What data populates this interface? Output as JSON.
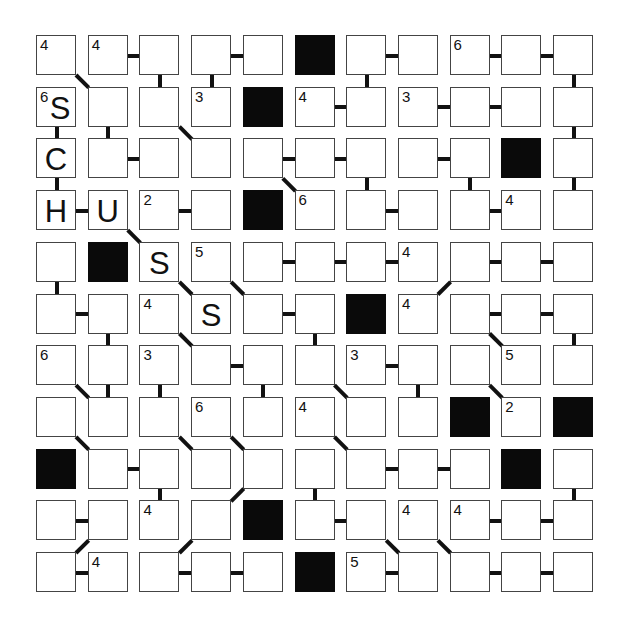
{
  "puzzle": {
    "type": "number-path-grid",
    "rows": 11,
    "cols": 11,
    "grid": [
      [
        {
          "c": "4"
        },
        {
          "c": "4"
        },
        {},
        {},
        {},
        {
          "b": 1
        },
        {},
        {},
        {
          "c": "6"
        },
        {},
        {}
      ],
      [
        {
          "c": "6",
          "l": "S"
        },
        {},
        {},
        {
          "c": "3"
        },
        {
          "b": 1
        },
        {
          "c": "4"
        },
        {},
        {
          "c": "3"
        },
        {},
        {},
        {}
      ],
      [
        {
          "l": "C"
        },
        {},
        {},
        {},
        {},
        {},
        {},
        {},
        {},
        {
          "b": 1
        },
        {}
      ],
      [
        {
          "l": "H"
        },
        {
          "l": "U"
        },
        {
          "c": "2"
        },
        {},
        {
          "b": 1
        },
        {
          "c": "6"
        },
        {},
        {},
        {},
        {
          "c": "4"
        },
        {}
      ],
      [
        {},
        {
          "b": 1
        },
        {
          "l": "S"
        },
        {
          "c": "5"
        },
        {},
        {},
        {},
        {
          "c": "4"
        },
        {},
        {},
        {}
      ],
      [
        {},
        {},
        {
          "c": "4"
        },
        {
          "l": "S"
        },
        {},
        {},
        {
          "b": 1
        },
        {
          "c": "4"
        },
        {},
        {},
        {}
      ],
      [
        {
          "c": "6"
        },
        {},
        {
          "c": "3"
        },
        {},
        {},
        {},
        {
          "c": "3"
        },
        {},
        {},
        {
          "c": "5"
        },
        {}
      ],
      [
        {},
        {},
        {},
        {
          "c": "6"
        },
        {},
        {
          "c": "4"
        },
        {},
        {},
        {
          "b": 1
        },
        {
          "c": "2"
        },
        {
          "b": 1
        }
      ],
      [
        {
          "b": 1
        },
        {},
        {},
        {},
        {},
        {},
        {},
        {},
        {},
        {
          "b": 1
        },
        {}
      ],
      [
        {},
        {},
        {
          "c": "4"
        },
        {},
        {
          "b": 1
        },
        {},
        {},
        {
          "c": "4"
        },
        {
          "c": "4"
        },
        {},
        {}
      ],
      [
        {},
        {
          "c": "4"
        },
        {},
        {},
        {},
        {
          "b": 1
        },
        {
          "c": "5"
        },
        {},
        {},
        {},
        {}
      ]
    ],
    "connectors": [
      [
        0,
        0,
        1,
        1
      ],
      [
        0,
        1,
        0,
        2
      ],
      [
        0,
        2,
        1,
        2
      ],
      [
        0,
        3,
        1,
        3
      ],
      [
        0,
        3,
        0,
        4
      ],
      [
        0,
        6,
        0,
        7
      ],
      [
        0,
        6,
        1,
        6
      ],
      [
        0,
        8,
        0,
        9
      ],
      [
        0,
        9,
        0,
        10
      ],
      [
        0,
        10,
        1,
        10
      ],
      [
        1,
        0,
        2,
        0
      ],
      [
        1,
        1,
        2,
        1
      ],
      [
        1,
        2,
        2,
        3
      ],
      [
        1,
        5,
        1,
        6
      ],
      [
        1,
        7,
        1,
        8
      ],
      [
        1,
        8,
        1,
        9
      ],
      [
        1,
        10,
        2,
        10
      ],
      [
        2,
        1,
        2,
        2
      ],
      [
        2,
        4,
        2,
        5
      ],
      [
        2,
        5,
        2,
        6
      ],
      [
        2,
        7,
        2,
        8
      ],
      [
        2,
        0,
        3,
        0
      ],
      [
        2,
        4,
        3,
        5
      ],
      [
        2,
        6,
        3,
        6
      ],
      [
        2,
        8,
        3,
        8
      ],
      [
        2,
        10,
        3,
        10
      ],
      [
        3,
        0,
        3,
        1
      ],
      [
        3,
        2,
        3,
        3
      ],
      [
        3,
        6,
        3,
        7
      ],
      [
        3,
        8,
        3,
        9
      ],
      [
        3,
        1,
        4,
        2
      ],
      [
        4,
        4,
        4,
        5
      ],
      [
        4,
        5,
        4,
        6
      ],
      [
        4,
        6,
        4,
        7
      ],
      [
        4,
        8,
        4,
        9
      ],
      [
        4,
        9,
        4,
        10
      ],
      [
        4,
        0,
        5,
        0
      ],
      [
        4,
        2,
        5,
        3
      ],
      [
        4,
        3,
        5,
        4
      ],
      [
        4,
        8,
        5,
        7
      ],
      [
        5,
        0,
        5,
        1
      ],
      [
        5,
        4,
        5,
        5
      ],
      [
        5,
        8,
        5,
        9
      ],
      [
        5,
        9,
        5,
        10
      ],
      [
        5,
        1,
        6,
        1
      ],
      [
        5,
        2,
        6,
        3
      ],
      [
        5,
        5,
        6,
        5
      ],
      [
        5,
        8,
        6,
        9
      ],
      [
        5,
        10,
        6,
        10
      ],
      [
        6,
        3,
        6,
        4
      ],
      [
        6,
        6,
        6,
        7
      ],
      [
        6,
        0,
        7,
        1
      ],
      [
        6,
        1,
        7,
        1
      ],
      [
        6,
        2,
        7,
        2
      ],
      [
        6,
        4,
        7,
        4
      ],
      [
        6,
        5,
        7,
        6
      ],
      [
        6,
        7,
        7,
        7
      ],
      [
        6,
        8,
        7,
        9
      ],
      [
        7,
        0,
        8,
        1
      ],
      [
        7,
        2,
        8,
        3
      ],
      [
        7,
        3,
        8,
        4
      ],
      [
        7,
        5,
        8,
        6
      ],
      [
        8,
        1,
        8,
        2
      ],
      [
        8,
        6,
        8,
        7
      ],
      [
        8,
        7,
        8,
        8
      ],
      [
        8,
        2,
        9,
        2
      ],
      [
        8,
        4,
        9,
        3
      ],
      [
        8,
        5,
        9,
        5
      ],
      [
        8,
        10,
        9,
        10
      ],
      [
        9,
        0,
        9,
        1
      ],
      [
        9,
        5,
        9,
        6
      ],
      [
        9,
        8,
        9,
        9
      ],
      [
        9,
        9,
        9,
        10
      ],
      [
        9,
        1,
        10,
        0
      ],
      [
        9,
        3,
        10,
        2
      ],
      [
        9,
        6,
        10,
        7
      ],
      [
        9,
        7,
        10,
        8
      ],
      [
        10,
        0,
        10,
        1
      ],
      [
        10,
        2,
        10,
        3
      ],
      [
        10,
        3,
        10,
        4
      ],
      [
        10,
        6,
        10,
        7
      ],
      [
        10,
        8,
        10,
        9
      ],
      [
        10,
        9,
        10,
        10
      ]
    ]
  },
  "colors": {
    "cell_border": "#444444",
    "block": "#0a0a0a",
    "connector": "#111111",
    "background": "#ffffff"
  }
}
